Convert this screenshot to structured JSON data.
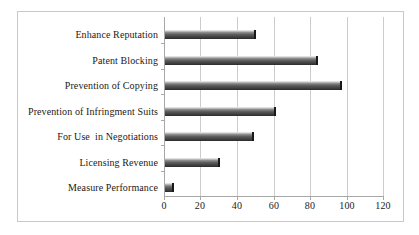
{
  "chart_data": {
    "type": "bar",
    "orientation": "horizontal",
    "title": "",
    "xlabel": "",
    "ylabel": "",
    "categories": [
      "Enhance Reputation",
      "Patent Blocking",
      "Prevention of Copying",
      "Prevention of Infringment Suits",
      "For Use  in Negotiations",
      "Licensing Revenue",
      "Measure Performance"
    ],
    "values": [
      50,
      84,
      97,
      61,
      49,
      30,
      5
    ],
    "xlim": [
      0,
      120
    ],
    "xticks": [
      0,
      20,
      40,
      60,
      80,
      100,
      120
    ],
    "xtick_labels": [
      "0",
      "20",
      "40",
      "60",
      "80",
      "100",
      "120"
    ],
    "grid": "vertical",
    "legend": "none",
    "series": [
      {
        "name": "Reasons for Patenting",
        "values": [
          50,
          84,
          97,
          61,
          49,
          30,
          5
        ]
      }
    ]
  },
  "style": {
    "bar_fill_dark": "#414141",
    "bar_fill_light": "#d8d8d8",
    "bar_edge": "#191919",
    "gridline_color": "#cccccc",
    "axis_color": "#a8a8a8",
    "frame_color": "#c9c9c9",
    "background": "#ffffff",
    "text_color": "#1a1a1a"
  }
}
